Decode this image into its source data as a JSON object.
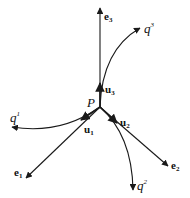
{
  "diagram": {
    "point": {
      "label": "P"
    },
    "basis_vectors": [
      {
        "label": "e",
        "sub": "1"
      },
      {
        "label": "e",
        "sub": "2"
      },
      {
        "label": "e",
        "sub": "3"
      }
    ],
    "tangent_vectors": [
      {
        "label": "u",
        "sub": "1"
      },
      {
        "label": "u",
        "sub": "2"
      },
      {
        "label": "u",
        "sub": "3"
      }
    ],
    "coordinate_curves": [
      {
        "label": "q",
        "sup": "1"
      },
      {
        "label": "q",
        "sup": "2"
      },
      {
        "label": "q",
        "sup": "3"
      }
    ],
    "line_color": "#1a1a1a"
  }
}
